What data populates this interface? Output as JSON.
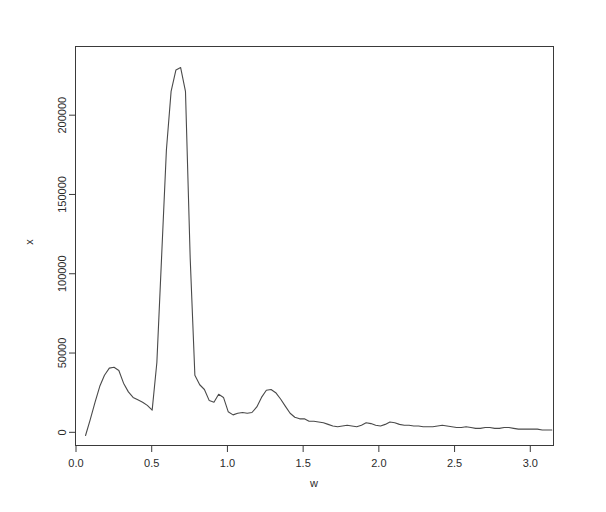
{
  "figure": {
    "background": "#ffffff",
    "line_color": "#4a4a4a",
    "axis_color": "#3a3a3a"
  },
  "chart_data": {
    "type": "line",
    "title": "",
    "subtitle": "",
    "xlabel": "w",
    "ylabel": "x",
    "xlim": [
      0.0,
      3.15
    ],
    "ylim": [
      -8000,
      243000
    ],
    "grid": false,
    "legend": null,
    "xticks": [
      0.0,
      0.5,
      1.0,
      1.5,
      2.0,
      2.5,
      3.0
    ],
    "xticklabels": [
      "0.0",
      "0.5",
      "1.0",
      "1.5",
      "2.0",
      "2.5",
      "3.0"
    ],
    "yticks": [
      0,
      50000,
      100000,
      150000,
      200000
    ],
    "yticklabels": [
      "0",
      "50000",
      "100000",
      "150000",
      "200000"
    ],
    "series": [
      {
        "name": "spectrum",
        "x": [
          0.063,
          0.094,
          0.126,
          0.157,
          0.188,
          0.22,
          0.251,
          0.283,
          0.314,
          0.346,
          0.377,
          0.408,
          0.44,
          0.471,
          0.503,
          0.534,
          0.565,
          0.597,
          0.628,
          0.66,
          0.691,
          0.723,
          0.754,
          0.785,
          0.817,
          0.848,
          0.88,
          0.911,
          0.942,
          0.974,
          1.005,
          1.037,
          1.068,
          1.1,
          1.131,
          1.162,
          1.194,
          1.225,
          1.257,
          1.288,
          1.319,
          1.351,
          1.382,
          1.414,
          1.445,
          1.477,
          1.508,
          1.539,
          1.571,
          1.602,
          1.634,
          1.665,
          1.696,
          1.728,
          1.759,
          1.791,
          1.822,
          1.854,
          1.885,
          1.916,
          1.948,
          1.979,
          2.011,
          2.042,
          2.073,
          2.105,
          2.136,
          2.168,
          2.199,
          2.231,
          2.262,
          2.293,
          2.325,
          2.356,
          2.388,
          2.419,
          2.45,
          2.482,
          2.513,
          2.545,
          2.576,
          2.608,
          2.639,
          2.67,
          2.702,
          2.733,
          2.765,
          2.796,
          2.827,
          2.859,
          2.89,
          2.922,
          2.953,
          2.985,
          3.016,
          3.047,
          3.079,
          3.11,
          3.142
        ],
        "y": [
          -2000,
          8000,
          19000,
          29000,
          36000,
          40500,
          41000,
          39000,
          31000,
          25500,
          22000,
          20500,
          19000,
          17000,
          14000,
          44000,
          110000,
          178000,
          215000,
          228500,
          230000,
          215000,
          110000,
          36000,
          30000,
          27000,
          20000,
          19000,
          24000,
          22000,
          13000,
          11000,
          12000,
          12500,
          12000,
          12500,
          16000,
          22000,
          26500,
          27000,
          25000,
          21000,
          16500,
          12000,
          9500,
          8500,
          8500,
          7000,
          7000,
          6500,
          6000,
          5000,
          4000,
          3500,
          4000,
          4500,
          4000,
          3500,
          4500,
          6000,
          5500,
          4500,
          4000,
          5000,
          6500,
          6000,
          5000,
          4500,
          4500,
          4000,
          4000,
          3500,
          3500,
          3500,
          4000,
          4500,
          4000,
          3500,
          3000,
          3000,
          3500,
          3000,
          2500,
          2500,
          3000,
          3000,
          2500,
          2500,
          3000,
          3000,
          2500,
          2000,
          2000,
          2000,
          2000,
          2000,
          1500,
          1500,
          1500
        ]
      }
    ]
  }
}
